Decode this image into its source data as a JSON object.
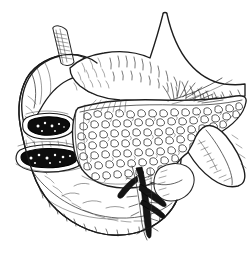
{
  "figure": {
    "title": "Stomach, pancreas and duodenum — pen-and-ink anatomical drawing",
    "caption": "",
    "medium": "pen-and-ink line engraving",
    "palette": {
      "background": "#ffffff",
      "ink": "#1b1b1b",
      "lesion_fill": "#0d0d0d",
      "hatch": "#333333"
    },
    "canvas": {
      "width": 250,
      "height": 253
    }
  },
  "structures": [
    {
      "id": "esophagus",
      "label": "Esophagus",
      "note": "short cut tube stub rising at upper left of stomach",
      "texture": "longitudinal hatching"
    },
    {
      "id": "gastric-fundus",
      "label": "Gastric fundus",
      "note": "rounded dome at upper left",
      "texture": "fine contour hatching"
    },
    {
      "id": "stomach-body",
      "label": "Body of stomach",
      "note": "large organ filling upper and left of frame",
      "texture": "dash / flick hatching following curvature"
    },
    {
      "id": "greater-curvature",
      "label": "Greater curvature",
      "note": "long convex lower-left border of stomach"
    },
    {
      "id": "lesser-curvature",
      "label": "Lesser curvature",
      "note": "concave right border of stomach"
    },
    {
      "id": "ulcer-upper",
      "label": "Upper ulcer crater",
      "note": "solid black lesion with raised white rim, upper of the pair",
      "fill": "#0d0d0d"
    },
    {
      "id": "ulcer-lower",
      "label": "Lower ulcer crater",
      "note": "solid black lesion with raised white rim, lower of the pair",
      "fill": "#0d0d0d"
    },
    {
      "id": "pancreas",
      "label": "Pancreas",
      "note": "central wedge with dense lobulated squiggle texture",
      "texture": "lobulated / acinar stipple"
    },
    {
      "id": "pancreatic-tail",
      "label": "Tail of pancreas",
      "note": "extends to right margin"
    },
    {
      "id": "duodenum",
      "label": "Duodenum",
      "note": "C-shaped loop descending at right",
      "texture": "transverse contour hatching"
    },
    {
      "id": "mesenteric-vessels",
      "label": "Mesenteric vessels",
      "note": "dark branching vascular bundle below pancreas, lower centre-right",
      "fill": "#141414"
    },
    {
      "id": "omentum-fringe",
      "label": "Omental fringe",
      "note": "feathered brush strokes along upper pancreatic border"
    }
  ]
}
